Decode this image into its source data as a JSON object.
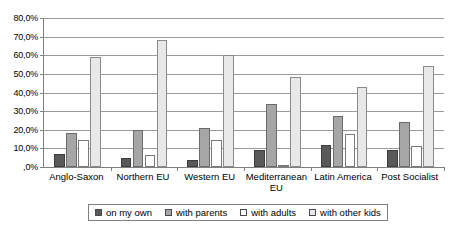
{
  "chart_data": {
    "type": "bar",
    "title": "",
    "subtitle": "",
    "xlabel": "",
    "ylabel": "",
    "ylim": [
      0,
      80
    ],
    "ytick_values": [
      0,
      10,
      20,
      30,
      40,
      50,
      60,
      70,
      80
    ],
    "ytick_labels": [
      ",0%",
      "10,0%",
      "20,0%",
      "30,0%",
      "40,0%",
      "50,0%",
      "60,0%",
      "70,0%",
      "80,0%"
    ],
    "grid": true,
    "legend_position": "bottom",
    "categories": [
      "Anglo-Saxon",
      "Northern EU",
      "Western EU",
      "Mediterranean EU",
      "Latin America",
      "Post Socialist"
    ],
    "series": [
      {
        "name": "on my own",
        "color": "#595959",
        "values": [
          7.0,
          5.0,
          4.0,
          9.0,
          12.0,
          9.0
        ]
      },
      {
        "name": "with parents",
        "color": "#a6a6a6",
        "values": [
          18.5,
          20.0,
          21.0,
          34.0,
          27.5,
          24.0
        ]
      },
      {
        "name": "with adults",
        "color": "#ffffff",
        "values": [
          14.5,
          6.5,
          14.5,
          1.0,
          17.5,
          11.5
        ]
      },
      {
        "name": "with other kids",
        "color": "#e8e8e8",
        "values": [
          59.0,
          68.0,
          60.0,
          48.5,
          43.0,
          54.0
        ]
      }
    ]
  }
}
